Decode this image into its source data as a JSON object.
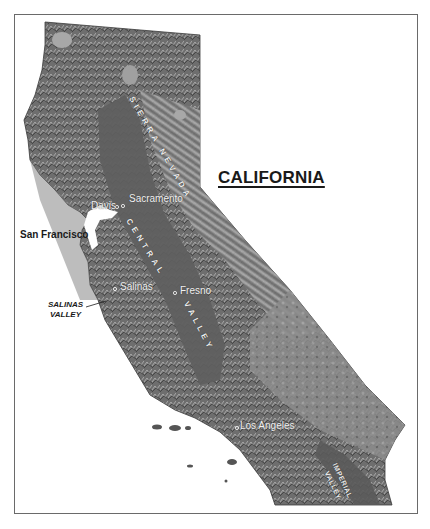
{
  "map": {
    "title": "CALIFORNIA",
    "cities": [
      {
        "name": "Davis"
      },
      {
        "name": "Sacramento"
      },
      {
        "name": "San Francisco"
      },
      {
        "name": "Salinas"
      },
      {
        "name": "Fresno"
      },
      {
        "name": "Los Angeles"
      }
    ],
    "regions": {
      "sierra_nevada": "SIERRA NEVADA",
      "central": "CENTRAL",
      "valley": "VALLEY",
      "salinas_valley_line1": "SALINAS",
      "salinas_valley_line2": "VALLEY",
      "imperial": "IMPERIAL",
      "imperial_valley": "VALLEY"
    },
    "colors": {
      "terrain_dark": "#4a4a4a",
      "terrain_mid": "#7a7a7a",
      "terrain_light": "#b5b5b5",
      "valley_floor": "#5e5e5e",
      "frame": "#6a6a6a",
      "background": "#ffffff"
    }
  }
}
